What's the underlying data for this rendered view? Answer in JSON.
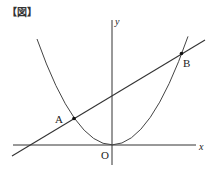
{
  "figure": {
    "caption": "【図】",
    "labels": {
      "y_axis": "y",
      "x_axis": "x",
      "origin": "O",
      "point_a": "A",
      "point_b": "B"
    },
    "colors": {
      "stroke": "#333333",
      "point": "#111111",
      "background": "#ffffff"
    },
    "elements": {
      "parabola": "y = ax² (vertex at origin, opens upward)",
      "line": "line through A and B",
      "points": [
        "A",
        "B"
      ]
    }
  }
}
